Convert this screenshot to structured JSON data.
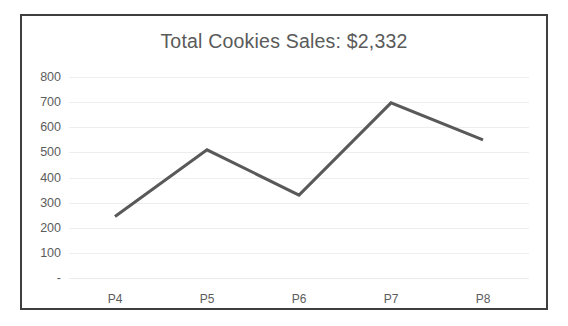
{
  "chart_data": {
    "type": "line",
    "title": "Total Cookies Sales: $2,332",
    "xlabel": "",
    "ylabel": "",
    "categories": [
      "P4",
      "P5",
      "P6",
      "P7",
      "P8"
    ],
    "values": [
      245,
      510,
      330,
      697,
      550
    ],
    "series": [
      {
        "name": "Cookies Sales",
        "values": [
          245,
          510,
          330,
          697,
          550
        ]
      }
    ],
    "ylim": [
      0,
      800
    ],
    "ytick_labels": [
      "800",
      "700",
      "600",
      "500",
      "400",
      "300",
      "200",
      "100",
      "-"
    ],
    "ytick_values": [
      800,
      700,
      600,
      500,
      400,
      300,
      200,
      100,
      0
    ],
    "xtick_labels": [
      "P4",
      "P5",
      "P6",
      "P7",
      "P8"
    ],
    "grid": true,
    "legend": "none",
    "markers": false,
    "total_label": "$2,332",
    "colors": {
      "line": "#595959",
      "grid": "#eeeeee",
      "text": "#5c5c5c",
      "title": "#5a5a5a",
      "frame_border": "#3f3f3f",
      "background": "#ffffff"
    },
    "line_width": 3
  }
}
